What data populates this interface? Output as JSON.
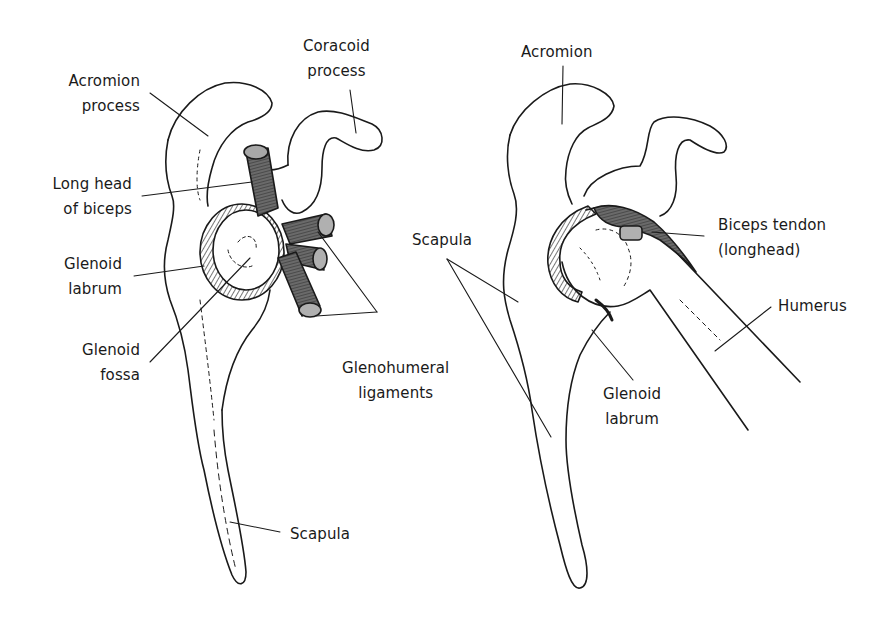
{
  "figure": {
    "left_panel": {
      "description": "Scapula and glenoid, lateral view with humerus removed",
      "labels": {
        "coracoid": [
          "Coracoid",
          "process"
        ],
        "acromion": [
          "Acromion",
          "process"
        ],
        "biceps": [
          "Long head",
          "of biceps"
        ],
        "labrum": [
          "Glenoid",
          "labrum"
        ],
        "fossa": [
          "Glenoid",
          "fossa"
        ],
        "ligaments": [
          "Glenohumeral",
          "ligaments"
        ],
        "scapula": "Scapula"
      }
    },
    "right_panel": {
      "description": "Shoulder joint with humerus in place",
      "labels": {
        "acromion": "Acromion",
        "biceps": [
          "Biceps tendon",
          "(longhead)"
        ],
        "scapula": "Scapula",
        "humerus": "Humerus",
        "labrum": [
          "Glenoid",
          "labrum"
        ]
      }
    },
    "colors": {
      "ink": "#1a1a1a",
      "tendon": "#555555",
      "tendon_end": "#b0b0b0",
      "background": "#ffffff"
    }
  }
}
